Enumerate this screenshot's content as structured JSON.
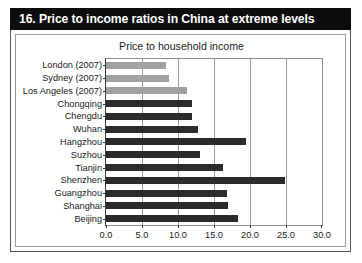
{
  "banner": {
    "title": "16. Price to income ratios in China at extreme levels"
  },
  "chart_data": {
    "type": "bar",
    "orientation": "horizontal",
    "title": "Price to household income",
    "xlabel": "",
    "ylabel": "",
    "xlim": [
      0.0,
      30.0
    ],
    "xticks": [
      "0.0",
      "5.0",
      "10.0",
      "15.0",
      "20.0",
      "25.0",
      "30.0"
    ],
    "xtick_values": [
      0,
      5,
      10,
      15,
      20,
      25,
      30
    ],
    "grid": true,
    "legend": "none",
    "categories": [
      "London (2007)",
      "Sydney (2007)",
      "Los Angeles (2007)",
      "Chongqing",
      "Chengdu",
      "Wuhan",
      "Hangzhou",
      "Suzhou",
      "Tianjin",
      "Shenzhen",
      "Guangzhou",
      "Shanghai",
      "Beijing"
    ],
    "values": [
      8.3,
      8.8,
      11.3,
      12.0,
      12.0,
      12.8,
      19.4,
      13.1,
      16.2,
      24.9,
      16.8,
      17.0,
      18.4
    ],
    "bar_styles": [
      "light",
      "light",
      "light",
      "dark",
      "dark",
      "dark",
      "dark",
      "dark",
      "dark",
      "dark",
      "dark",
      "dark",
      "dark"
    ],
    "colors": {
      "dark_bar": "#2b2b2b",
      "light_bar": "#a0a0a0",
      "banner": "#0d0d0d",
      "banner_text": "#ffffff",
      "grid": "#9d9d9d",
      "background": "#ffffff"
    }
  }
}
